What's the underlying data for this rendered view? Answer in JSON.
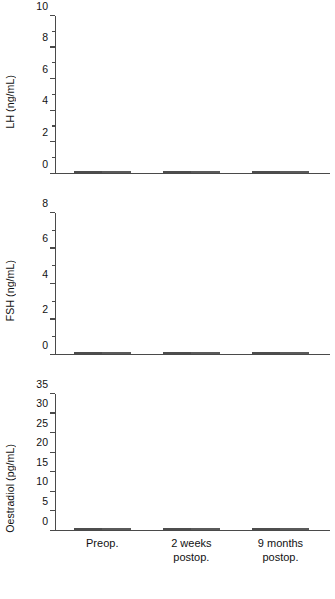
{
  "chart_data": {
    "type": "bar",
    "title": "",
    "xlabel": "",
    "categories": [
      "Preop.",
      "2 weeks\npostop.",
      "9 months\npostop."
    ],
    "legend": [
      "gray series",
      "white series"
    ],
    "legend_position": "none",
    "grid": false,
    "panels": [
      {
        "id": "lh",
        "ylabel": "LH (ng/mL)",
        "ylim": [
          0,
          10
        ],
        "ytick_step": 2,
        "yminor_step": 1,
        "yticks": [
          0,
          2,
          4,
          6,
          8,
          10
        ],
        "ytick_labels": [
          "0",
          "2",
          "4",
          "6",
          "8",
          "10"
        ],
        "series": [
          {
            "name": "gray",
            "values": [
              1.1,
              0.3,
              0.2
            ]
          },
          {
            "name": "white",
            "values": [
              8.0,
              0.85,
              0.95
            ]
          }
        ]
      },
      {
        "id": "fsh",
        "ylabel": "FSH (ng/mL)",
        "ylim": [
          0,
          8
        ],
        "ytick_step": 2,
        "yminor_step": 1,
        "yticks": [
          0,
          2,
          4,
          6,
          8
        ],
        "ytick_labels": [
          "0",
          "2",
          "4",
          "6",
          "8"
        ],
        "series": [
          {
            "name": "gray",
            "values": [
              2.05,
              0.28,
              0.68
            ]
          },
          {
            "name": "white",
            "values": [
              6.0,
              4.0,
              4.95
            ]
          }
        ]
      },
      {
        "id": "oe",
        "ylabel": "Oestradiol (pg/mL)",
        "ylim": [
          0,
          35
        ],
        "ytick_step": 5,
        "yminor_step": 5,
        "yticks": [
          0,
          5,
          10,
          15,
          20,
          25,
          30,
          35
        ],
        "ytick_labels": [
          "0",
          "5",
          "10",
          "15",
          "20",
          "25",
          "30",
          "35"
        ],
        "series": [
          {
            "name": "gray",
            "values": [
              1.1,
              1.0,
              1.1
            ]
          },
          {
            "name": "white",
            "values": [
              29.7,
              26.6,
              1.1
            ]
          }
        ]
      }
    ]
  },
  "colors": {
    "gray_bar": "#808080",
    "white_bar": "#ffffff",
    "bar_outline": "#555555",
    "axis": "#4a4a4a",
    "text": "#111111",
    "background": "#ffffff"
  },
  "panel_lh": {
    "ylabel": "LH (ng/mL)"
  },
  "panel_fsh": {
    "ylabel": "FSH (ng/mL)"
  },
  "panel_oe": {
    "ylabel": "Oestradiol (pg/mL)"
  },
  "xaxis": {
    "labels": [
      "Preop.",
      "2 weeks\npostop.",
      "9 months\npostop."
    ]
  }
}
